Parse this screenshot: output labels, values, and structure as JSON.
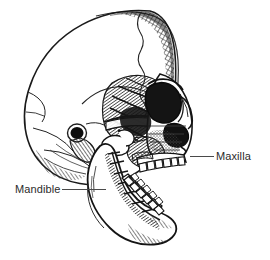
{
  "figure": {
    "kind": "anatomical-illustration",
    "orientation": "facing right, mandible open",
    "style": "black and white pen-and-ink line drawing with cross-hatch shading",
    "background_color": "#ffffff",
    "ink_color": "#1a1a1a",
    "shading_color": "#5a5a5a"
  },
  "labels": [
    {
      "id": "maxilla",
      "text": "Maxilla",
      "side": "right",
      "leader": {
        "x1": 190,
        "y1": 156,
        "x2": 214,
        "y2": 156
      },
      "text_x": 216,
      "text_y": 150
    },
    {
      "id": "mandible",
      "text": "Mandible",
      "side": "left",
      "leader": {
        "x1": 62,
        "y1": 189,
        "x2": 106,
        "y2": 189
      },
      "text_x": 15,
      "text_y": 183
    }
  ],
  "colors": {
    "text": "#2b2b2b",
    "leader_line": "#4a4a4a",
    "outline": "#1a1a1a",
    "background": "#ffffff"
  }
}
